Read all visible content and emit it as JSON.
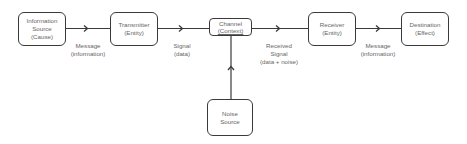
{
  "diagram": {
    "nodes": [
      {
        "id": "source",
        "line1": "Information",
        "line2": "Source",
        "line3": "(Cause)"
      },
      {
        "id": "transmitter",
        "line1": "Transmitter",
        "line2": "(Entity)"
      },
      {
        "id": "channel",
        "line1": "Channel",
        "line2": "(Context)"
      },
      {
        "id": "receiver",
        "line1": "Receiver",
        "line2": "(Entity)"
      },
      {
        "id": "destination",
        "line1": "Destination",
        "line2": "(Effect)"
      },
      {
        "id": "noise",
        "line1": "Noise",
        "line2": "Source"
      }
    ],
    "edges": [
      {
        "from": "source",
        "to": "transmitter",
        "line1": "Message",
        "line2": "(information)"
      },
      {
        "from": "transmitter",
        "to": "channel",
        "line1": "Signal",
        "line2": "(data)"
      },
      {
        "from": "channel",
        "to": "receiver",
        "line1": "Received",
        "line2": "Signal",
        "line3": "(data + noise)"
      },
      {
        "from": "receiver",
        "to": "destination",
        "line1": "Message",
        "line2": "(information)"
      },
      {
        "from": "noise",
        "to": "channel"
      }
    ],
    "colors": {
      "stroke": "#3a3a3a",
      "text": "#666666",
      "background": "#ffffff"
    }
  }
}
